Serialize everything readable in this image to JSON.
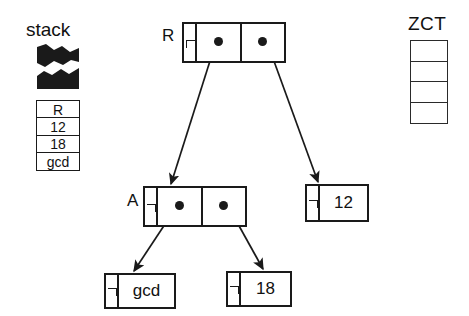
{
  "figure": {
    "background_color": "#ffffff",
    "ink_color": "#1a1a1a"
  },
  "stack": {
    "title": "stack",
    "torn_top": true,
    "cells": [
      {
        "label": "R"
      },
      {
        "label": "12"
      },
      {
        "label": "18"
      },
      {
        "label": "gcd"
      }
    ]
  },
  "zct": {
    "title": "ZCT",
    "cells": [
      {
        "label": ""
      },
      {
        "label": ""
      },
      {
        "label": ""
      },
      {
        "label": ""
      }
    ]
  },
  "nodes": {
    "r": {
      "label": "R",
      "tag": "cons-tag",
      "slots": [
        {
          "name": "car",
          "pointer": true
        },
        {
          "name": "cdr",
          "pointer": true
        }
      ]
    },
    "a": {
      "label": "A",
      "tag": "cons-tag",
      "slots": [
        {
          "name": "car",
          "pointer": true
        },
        {
          "name": "cdr",
          "pointer": true
        }
      ]
    },
    "twelve": {
      "tag": "value-tag",
      "value": "12"
    },
    "gcd": {
      "tag": "value-tag",
      "value": "gcd"
    },
    "eighteen": {
      "tag": "value-tag",
      "value": "18"
    }
  },
  "arrows": [
    {
      "name": "r-car-to-a",
      "from": "r.car",
      "to": "a"
    },
    {
      "name": "r-cdr-to-12",
      "from": "r.cdr",
      "to": "twelve"
    },
    {
      "name": "a-car-to-gcd",
      "from": "a.car",
      "to": "gcd"
    },
    {
      "name": "a-cdr-to-18",
      "from": "a.cdr",
      "to": "eighteen"
    }
  ]
}
